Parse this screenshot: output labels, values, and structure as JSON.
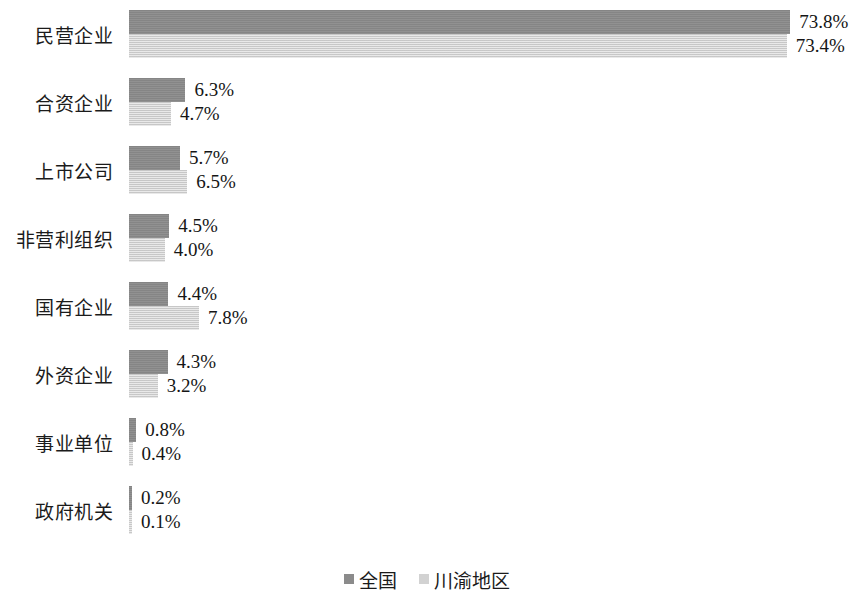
{
  "chart_data": {
    "type": "bar",
    "orientation": "horizontal",
    "title": "",
    "xlabel": "",
    "ylabel": "",
    "grid": false,
    "legend_position": "bottom",
    "xlim": [
      0,
      73.8
    ],
    "value_suffix": "%",
    "categories": [
      "民营企业",
      "合资企业",
      "上市公司",
      "非营利组织",
      "国有企业",
      "外资企业",
      "事业单位",
      "政府机关"
    ],
    "series": [
      {
        "name": "全国",
        "color": "#8b8b8b",
        "values": [
          73.8,
          6.3,
          5.7,
          4.5,
          4.4,
          4.3,
          0.8,
          0.2
        ],
        "labels": [
          "73.8%",
          "6.3%",
          "5.7%",
          "4.5%",
          "4.4%",
          "4.3%",
          "0.8%",
          "0.2%"
        ]
      },
      {
        "name": "川渝地区",
        "color": "#d2d2d2",
        "values": [
          73.4,
          4.7,
          6.5,
          4.0,
          7.8,
          3.2,
          0.4,
          0.1
        ],
        "labels": [
          "73.4%",
          "4.7%",
          "6.5%",
          "4.0%",
          "7.8%",
          "3.2%",
          "0.4%",
          "0.1%"
        ]
      }
    ]
  },
  "legend": {
    "items": [
      {
        "label": "全国",
        "color": "#8b8b8b"
      },
      {
        "label": "川渝地区",
        "color": "#d2d2d2"
      }
    ]
  }
}
